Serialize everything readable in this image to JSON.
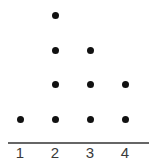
{
  "chart_data": {
    "type": "scatter",
    "subtype": "dot_plot",
    "title": "",
    "xlabel": "",
    "ylabel": "",
    "categories": [
      "1",
      "2",
      "3",
      "4"
    ],
    "values": [
      1,
      4,
      3,
      2
    ],
    "points": [
      {
        "x": 1,
        "stack": 1
      },
      {
        "x": 2,
        "stack": 1
      },
      {
        "x": 2,
        "stack": 2
      },
      {
        "x": 2,
        "stack": 3
      },
      {
        "x": 2,
        "stack": 4
      },
      {
        "x": 3,
        "stack": 1
      },
      {
        "x": 3,
        "stack": 2
      },
      {
        "x": 3,
        "stack": 3
      },
      {
        "x": 4,
        "stack": 1
      },
      {
        "x": 4,
        "stack": 2
      }
    ],
    "xlim": [
      1,
      4
    ],
    "grid": false,
    "legend": null,
    "colors": {
      "dot": "#111111",
      "axis": "#666666",
      "label": "#3a3a3a"
    }
  },
  "axis": {
    "tick_labels": [
      "1",
      "2",
      "3",
      "4"
    ]
  }
}
